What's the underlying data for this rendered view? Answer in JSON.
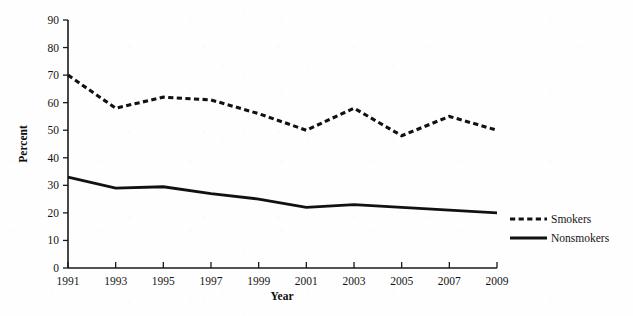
{
  "chart_data": {
    "type": "line",
    "title": "",
    "xlabel": "Year",
    "ylabel": "Percent",
    "x": [
      1991,
      1993,
      1995,
      1997,
      1999,
      2001,
      2003,
      2005,
      2007,
      2009
    ],
    "xtick_labels": [
      "1991",
      "1993",
      "1995",
      "1997",
      "1999",
      "2001",
      "2003",
      "2005",
      "2007",
      "2009"
    ],
    "xlim": [
      1991,
      2009
    ],
    "ylim": [
      0,
      90
    ],
    "ytick_labels": [
      "0",
      "10",
      "20",
      "30",
      "40",
      "50",
      "60",
      "70",
      "80",
      "90"
    ],
    "yticks": [
      0,
      10,
      20,
      30,
      40,
      50,
      60,
      70,
      80,
      90
    ],
    "grid": false,
    "legend_position": "right",
    "series": [
      {
        "name": "Smokers",
        "style": "dashed",
        "color": "#111111",
        "values": [
          70,
          58,
          62,
          61,
          56,
          50,
          58,
          48,
          55,
          50
        ]
      },
      {
        "name": "Nonsmokers",
        "style": "solid",
        "color": "#111111",
        "values": [
          33,
          29,
          29.5,
          27,
          25,
          22,
          23,
          22,
          21,
          20
        ]
      }
    ]
  },
  "legend": {
    "items": [
      {
        "label": "Smokers",
        "style": "dashed"
      },
      {
        "label": "Nonsmokers",
        "style": "solid"
      }
    ]
  },
  "axes": {
    "y_title": "Percent",
    "x_title": "Year"
  }
}
